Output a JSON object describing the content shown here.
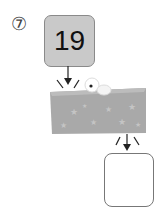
{
  "problem": {
    "number_label": "⑦",
    "input_value": "19",
    "answer_value": ""
  },
  "colors": {
    "box_fill": "#c9c9c9",
    "machine_fill": "#a9a9a9",
    "machine_top": "#bcbcbc",
    "star": "#c4c4c4"
  }
}
